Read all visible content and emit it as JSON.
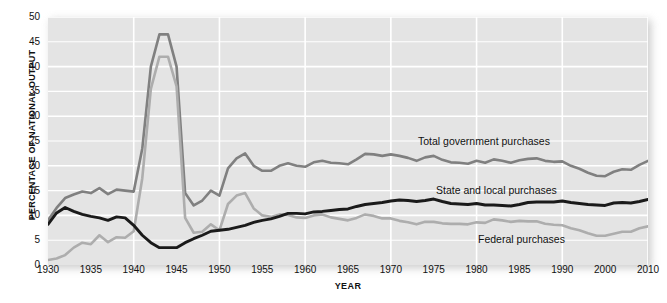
{
  "chart_data": {
    "type": "line",
    "title": "",
    "xlabel": "YEAR",
    "ylabel": "PERCENTAGE OF NATIONAL OUTPUT",
    "xlim": [
      1930,
      2010
    ],
    "ylim": [
      0,
      50
    ],
    "grid": true,
    "legend_position": "inline-annotations",
    "y_ticks": [
      0,
      5,
      10,
      15,
      20,
      25,
      30,
      35,
      40,
      45,
      50
    ],
    "x_ticks": [
      1930,
      1935,
      1940,
      1945,
      1950,
      1955,
      1960,
      1965,
      1970,
      1975,
      1980,
      1985,
      1990,
      2000,
      2010
    ],
    "x_tick_labels": [
      "1930",
      "1935",
      "1940",
      "1945",
      "1950",
      "1955",
      "1960",
      "1965",
      "1970",
      "1975",
      "1980",
      "1985",
      "1990",
      "2000",
      "2010"
    ],
    "colors": {
      "total_government": "#808080",
      "state_and_local": "#1a1a1a",
      "federal": "#adadad",
      "plot_background": "#e4e4e4",
      "gridline": "#ffffff",
      "page_background": "#ffffff",
      "text": "#111111"
    },
    "x": [
      1930,
      1931,
      1932,
      1933,
      1934,
      1935,
      1936,
      1937,
      1938,
      1939,
      1940,
      1941,
      1942,
      1943,
      1944,
      1945,
      1946,
      1947,
      1948,
      1949,
      1950,
      1951,
      1952,
      1953,
      1954,
      1955,
      1956,
      1957,
      1958,
      1959,
      1960,
      1961,
      1962,
      1963,
      1964,
      1965,
      1966,
      1967,
      1968,
      1969,
      1970,
      1971,
      1972,
      1973,
      1974,
      1975,
      1976,
      1977,
      1978,
      1979,
      1980,
      1981,
      1982,
      1983,
      1984,
      1985,
      1986,
      1987,
      1988,
      1989,
      1990,
      1992,
      1994,
      1996,
      1998,
      2000,
      2002,
      2004,
      2006,
      2008,
      2010
    ],
    "series": [
      {
        "name": "Total government purchases",
        "color": "#808080",
        "values": [
          9.0,
          11.5,
          13.5,
          14.2,
          14.8,
          14.5,
          15.5,
          14.3,
          15.2,
          15.0,
          14.8,
          23.5,
          40.0,
          46.5,
          46.5,
          40.0,
          14.5,
          12.0,
          13.0,
          15.0,
          14.0,
          19.5,
          21.5,
          22.5,
          20.0,
          19.0,
          19.0,
          20.0,
          20.5,
          20.0,
          19.8,
          20.7,
          21.0,
          20.6,
          20.5,
          20.3,
          21.3,
          22.4,
          22.3,
          22.0,
          22.3,
          22.0,
          21.6,
          21.0,
          21.7,
          22.0,
          21.2,
          20.7,
          20.6,
          20.4,
          21.0,
          20.6,
          21.3,
          21.0,
          20.6,
          21.1,
          21.4,
          21.5,
          21.0,
          20.8,
          20.9,
          20.0,
          19.4,
          18.6,
          18.0,
          17.9,
          18.8,
          19.3,
          19.2,
          20.2,
          21.0
        ]
      },
      {
        "name": "State and local purchases",
        "color": "#1a1a1a",
        "values": [
          8.2,
          10.5,
          11.6,
          10.8,
          10.2,
          9.8,
          9.5,
          9.0,
          9.7,
          9.5,
          8.0,
          6.0,
          4.5,
          3.5,
          3.5,
          3.5,
          4.5,
          5.3,
          6.0,
          6.8,
          7.0,
          7.2,
          7.6,
          8.0,
          8.6,
          9.0,
          9.3,
          9.8,
          10.4,
          10.4,
          10.3,
          10.7,
          10.8,
          11.0,
          11.2,
          11.3,
          11.8,
          12.2,
          12.4,
          12.6,
          12.9,
          13.1,
          13.0,
          12.8,
          13.0,
          13.3,
          12.8,
          12.4,
          12.3,
          12.2,
          12.4,
          12.1,
          12.1,
          12.0,
          11.9,
          12.2,
          12.6,
          12.7,
          12.7,
          12.7,
          12.9,
          12.6,
          12.4,
          12.2,
          12.1,
          12.0,
          12.5,
          12.6,
          12.5,
          12.8,
          13.2
        ]
      },
      {
        "name": "Federal purchases",
        "color": "#adadad",
        "values": [
          1.0,
          1.3,
          2.0,
          3.5,
          4.5,
          4.2,
          6.0,
          4.6,
          5.6,
          5.5,
          6.8,
          17.5,
          35.5,
          42.0,
          42.0,
          36.0,
          9.5,
          6.5,
          6.7,
          8.2,
          7.0,
          12.3,
          14.0,
          14.5,
          11.4,
          10.0,
          9.7,
          10.2,
          10.1,
          9.6,
          9.5,
          10.0,
          10.2,
          9.6,
          9.3,
          9.0,
          9.5,
          10.2,
          9.9,
          9.4,
          9.4,
          8.9,
          8.6,
          8.2,
          8.7,
          8.7,
          8.4,
          8.3,
          8.3,
          8.2,
          8.6,
          8.5,
          9.2,
          9.0,
          8.7,
          8.9,
          8.8,
          8.8,
          8.3,
          8.1,
          8.0,
          7.4,
          7.0,
          6.4,
          5.9,
          5.9,
          6.3,
          6.7,
          6.7,
          7.4,
          7.8
        ]
      }
    ],
    "annotations": [
      {
        "text": "Total government purchases",
        "series": "Total government purchases",
        "x_px": 418,
        "y_px": 135
      },
      {
        "text": "State and local purchases",
        "series": "State and local purchases",
        "x_px": 436,
        "y_px": 184
      },
      {
        "text": "Federal purchases",
        "series": "Federal purchases",
        "x_px": 478,
        "y_px": 233
      }
    ]
  }
}
